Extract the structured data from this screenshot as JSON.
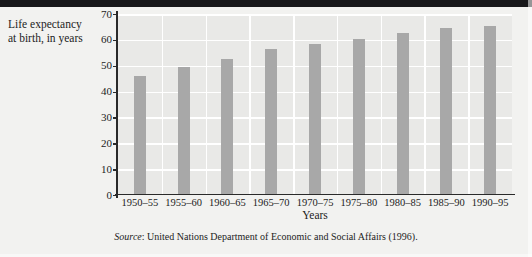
{
  "figure": {
    "y_axis_caption_line1": "Life expectancy",
    "y_axis_caption_line2": "at birth, in years",
    "x_axis_title": "Years",
    "source_prefix": "Source",
    "source_text": ": United Nations Department of Economic and Social Affairs (1996).",
    "colors": {
      "bar": "#a8a8a8",
      "plot_background": "#e9e9e7",
      "page_background": "#f2f2f0",
      "gridline": "#ffffff",
      "axis": "#2a2a2a",
      "top_rule": "#17171a",
      "text": "#1c1c1c"
    }
  },
  "chart_data": {
    "type": "bar",
    "title": "",
    "xlabel": "Years",
    "ylabel": "Life expectancy at birth, in years",
    "ylim": [
      0,
      70
    ],
    "ytick_labels": [
      "70",
      "60",
      "50",
      "40",
      "30",
      "20",
      "10",
      "0"
    ],
    "ytick_values": [
      70,
      60,
      50,
      40,
      30,
      20,
      10,
      0
    ],
    "grid": "horizontal and vertical white gridlines",
    "legend": "none",
    "categories": [
      "1950–55",
      "1955–60",
      "1960–65",
      "1965–70",
      "1970–75",
      "1975–80",
      "1980–85",
      "1985–90",
      "1990–95"
    ],
    "values": [
      46,
      49.5,
      52.5,
      56.5,
      58.5,
      60.5,
      62.5,
      64.5,
      65.5
    ],
    "annotation": "Source: United Nations Department of Economic and Social Affairs (1996)."
  }
}
